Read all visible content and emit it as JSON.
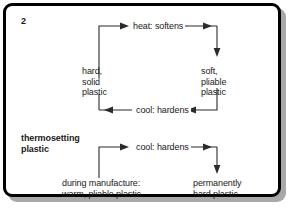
{
  "diagram": {
    "title_thermosoftening": "thermosoftening\nplastic\n(thermoplastic)",
    "title_thermosetting": "thermosetting\nplastic",
    "sections": [
      {
        "name": "thermosoftening",
        "heading_lines": [
          "thermosoftening",
          "plastic",
          "(thermoplastic)"
        ],
        "nodes": [
          {
            "id": "hard-solid-plastic",
            "lines": [
              "hard,",
              "solid",
              "plastic"
            ],
            "text": "hard,\nsolid\nplastic"
          },
          {
            "id": "soft-pliable-plastic",
            "lines": [
              "soft,",
              "pliable",
              "plastic"
            ],
            "text": "soft,\npliable\nplastic"
          }
        ],
        "edges": [
          {
            "id": "heat-softens",
            "label": "heat: softens",
            "direction": "right",
            "from": "hard-solid-plastic",
            "to": "soft-pliable-plastic"
          },
          {
            "id": "cool-hardens-top",
            "label": "cool: hardens",
            "direction": "left",
            "from": "soft-pliable-plastic",
            "to": "hard-solid-plastic"
          }
        ]
      },
      {
        "name": "thermosetting",
        "heading_lines": [
          "thermosetting",
          "plastic"
        ],
        "nodes": [
          {
            "id": "during-manufacture",
            "lines": [
              "during manufacture:",
              "warm, pliable plastic"
            ],
            "text": "during manufacture:\nwarm, pliable plastic"
          },
          {
            "id": "permanently-hard-plastic",
            "lines": [
              "permanently",
              "hard plastic"
            ],
            "text": "permanently\nhard plastic"
          }
        ],
        "edges": [
          {
            "id": "cool-hardens-bottom",
            "label": "cool: hardens",
            "direction": "right",
            "from": "during-manufacture",
            "to": "permanently-hard-plastic"
          }
        ]
      }
    ],
    "colors": {
      "border": "#000000",
      "shadow": "#a8a8a8",
      "background": "#ffffff",
      "text": "#1a1a1a",
      "line": "#2b2b2b"
    }
  }
}
